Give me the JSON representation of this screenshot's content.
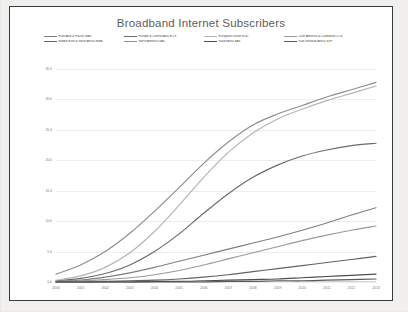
{
  "chart": {
    "title": "Broadband Internet Subscribers"
  },
  "legend": {
    "rows": [
      [
        {
          "label": "East Asia & Pacific EAS",
          "color": "#7f7f7f"
        },
        {
          "label": "Europe & Central Asia ECS",
          "color": "#6a6a6a"
        },
        {
          "label": "European Union EUU",
          "color": "#b4b4b4"
        },
        {
          "label": "Latin America & Caribbean LCN",
          "color": "#9a9a9a"
        }
      ],
      [
        {
          "label": "Middle East & North Africa MEA",
          "color": "#636363"
        },
        {
          "label": "North America NAC",
          "color": "#8d8d8d"
        },
        {
          "label": "South Asia SAS",
          "color": "#4d4d4d"
        },
        {
          "label": "Sub-Saharan Africa SSF",
          "color": "#5a5a5a"
        }
      ]
    ]
  },
  "chart_data": {
    "type": "line",
    "title": "Broadband Internet Subscribers",
    "xlabel": "",
    "ylabel": "",
    "x": [
      2000,
      2001,
      2002,
      2003,
      2004,
      2005,
      2006,
      2007,
      2008,
      2009,
      2010,
      2011,
      2012,
      2013
    ],
    "xlim": [
      2000,
      2013
    ],
    "ylim": [
      0.0,
      35.0
    ],
    "yticks": [
      0.0,
      5.0,
      10.0,
      15.0,
      20.0,
      25.0,
      30.0,
      35.0
    ],
    "ytick_labels": [
      "0.0",
      "5.0",
      "10.0",
      "15.0",
      "20.0",
      "25.0",
      "30.0",
      "35.0"
    ],
    "xtick_labels": [
      "2000",
      "2001",
      "2002",
      "2003",
      "2004",
      "2005",
      "2006",
      "2007",
      "2008",
      "2009",
      "2010",
      "2011",
      "2012",
      "2013"
    ],
    "grid": true,
    "legend_position": "top",
    "series": [
      {
        "name": "East Asia & Pacific EAS",
        "color": "#7f7f7f",
        "values": [
          0.1,
          0.3,
          0.8,
          1.5,
          2.4,
          3.4,
          4.4,
          5.4,
          6.4,
          7.4,
          8.5,
          9.7,
          11.0,
          12.2
        ]
      },
      {
        "name": "Europe & Central Asia ECS",
        "color": "#6a6a6a",
        "values": [
          0.2,
          0.6,
          1.4,
          2.8,
          5.0,
          7.9,
          11.3,
          14.5,
          17.2,
          19.2,
          20.7,
          21.7,
          22.4,
          22.8
        ]
      },
      {
        "name": "European Union EUU",
        "color": "#b4b4b4",
        "values": [
          0.3,
          1.0,
          2.4,
          4.8,
          8.3,
          12.6,
          17.2,
          21.3,
          24.5,
          26.8,
          28.4,
          29.8,
          31.0,
          32.2
        ]
      },
      {
        "name": "Latin America & Caribbean LCN",
        "color": "#9a9a9a",
        "values": [
          0.1,
          0.2,
          0.4,
          0.7,
          1.2,
          1.9,
          2.8,
          3.8,
          4.8,
          5.8,
          6.8,
          7.7,
          8.5,
          9.2
        ]
      },
      {
        "name": "Middle East & North Africa MEA",
        "color": "#636363",
        "values": [
          0.0,
          0.0,
          0.1,
          0.2,
          0.3,
          0.5,
          0.8,
          1.2,
          1.7,
          2.2,
          2.7,
          3.2,
          3.7,
          4.2
        ]
      },
      {
        "name": "North America NAC",
        "color": "#8d8d8d",
        "values": [
          1.3,
          2.8,
          5.0,
          8.0,
          11.6,
          15.5,
          19.5,
          23.0,
          25.8,
          27.6,
          29.0,
          30.4,
          31.6,
          32.8
        ]
      },
      {
        "name": "South Asia SAS",
        "color": "#4d4d4d",
        "values": [
          0.0,
          0.0,
          0.0,
          0.0,
          0.1,
          0.1,
          0.2,
          0.3,
          0.4,
          0.5,
          0.7,
          0.9,
          1.1,
          1.3
        ]
      },
      {
        "name": "Sub-Saharan Africa SSF",
        "color": "#5a5a5a",
        "values": [
          0.0,
          0.0,
          0.0,
          0.0,
          0.0,
          0.0,
          0.0,
          0.1,
          0.1,
          0.2,
          0.2,
          0.3,
          0.4,
          0.5
        ]
      }
    ]
  }
}
